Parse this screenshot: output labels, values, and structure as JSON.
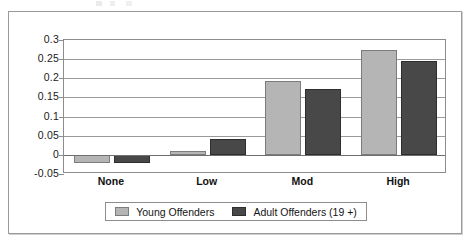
{
  "chart_data": {
    "type": "bar",
    "title": "",
    "xlabel": "",
    "ylabel": "",
    "categories": [
      "None",
      "Low",
      "Mod",
      "High"
    ],
    "series": [
      {
        "name": "Young Offenders",
        "color": "#b5b5b5",
        "values": [
          -0.021,
          0.01,
          0.192,
          0.273
        ]
      },
      {
        "name": "Adult Offenders (19 +)",
        "color": "#484848",
        "values": [
          -0.02,
          0.042,
          0.173,
          0.245
        ]
      }
    ],
    "ylim": [
      -0.05,
      0.3
    ],
    "yticks": [
      0.3,
      0.25,
      0.2,
      0.15,
      0.1,
      0.05,
      0,
      -0.05
    ],
    "ytick_labels": [
      "0.3",
      "0.25",
      "0.2",
      "0.15",
      "0.1",
      "0.05",
      "0",
      "-0.05"
    ],
    "grid": true,
    "legend_position": "bottom"
  },
  "legend": {
    "entries": [
      {
        "label": "Young Offenders",
        "swatch": "young-swatch"
      },
      {
        "label": "Adult Offenders (19 +)",
        "swatch": "adult-swatch"
      }
    ]
  }
}
